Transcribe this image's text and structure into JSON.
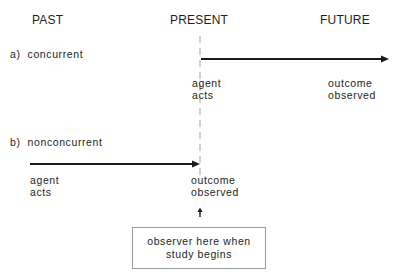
{
  "headers": {
    "past": "PAST",
    "present": "PRESENT",
    "future": "FUTURE"
  },
  "concurrent": {
    "label": "a)  concurrent",
    "start_label_line1": "agent",
    "start_label_line2": "acts",
    "end_label_line1": "outcome",
    "end_label_line2": "observed"
  },
  "nonconcurrent": {
    "label": "b)  nonconcurrent",
    "start_label_line1": "agent",
    "start_label_line2": "acts",
    "end_label_line1": "outcome",
    "end_label_line2": "observed"
  },
  "observer_box": {
    "line1": "observer here when",
    "line2": "study begins"
  },
  "colors": {
    "line": "#1a1a1a",
    "dashed": "#b5b5b5",
    "box_border": "#9a9a9a"
  }
}
